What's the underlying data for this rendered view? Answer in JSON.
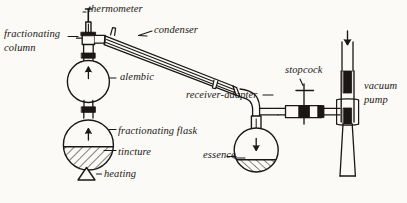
{
  "diagram": {
    "type": "hand-drawn scientific illustration",
    "background_color": "#fbfaf6",
    "ink_color": "#1a1714",
    "labels": [
      {
        "id": "thermometer",
        "text": "thermometer",
        "x": 88,
        "y": 5,
        "align": "left"
      },
      {
        "id": "fractionating-column",
        "text": "fractionating",
        "x": 4,
        "y": 30,
        "align": "left"
      },
      {
        "id": "column-line2",
        "text": "column",
        "x": 4,
        "y": 44,
        "align": "left"
      },
      {
        "id": "condenser",
        "text": "condenser",
        "x": 155,
        "y": 27,
        "align": "left"
      },
      {
        "id": "alembic",
        "text": "alembic",
        "x": 122,
        "y": 73,
        "align": "left"
      },
      {
        "id": "stopcock",
        "text": "stopcock",
        "x": 285,
        "y": 67,
        "align": "left"
      },
      {
        "id": "vacuum-pump",
        "text": "vacuum",
        "x": 363,
        "y": 82,
        "align": "left"
      },
      {
        "id": "vacuum-pump-line2",
        "text": "pump",
        "x": 363,
        "y": 96,
        "align": "left"
      },
      {
        "id": "receiver-adapter",
        "text": "receiver-adapter",
        "x": 188,
        "y": 91,
        "align": "left"
      },
      {
        "id": "fractionating-flask",
        "text": "fractionating flask",
        "x": 119,
        "y": 127,
        "align": "left"
      },
      {
        "id": "tincture",
        "text": "tincture",
        "x": 119,
        "y": 148,
        "align": "left"
      },
      {
        "id": "essence",
        "text": "essence",
        "x": 204,
        "y": 151,
        "align": "left"
      },
      {
        "id": "heating",
        "text": "heating",
        "x": 104,
        "y": 174,
        "align": "left"
      }
    ],
    "components": [
      {
        "id": "thermometer",
        "name": "thermometer",
        "note": "vertical stem with cross bar at top entering the column head"
      },
      {
        "id": "fractionating-column",
        "name": "fractionating column",
        "note": "vertical column above the alembic with ground-glass joints"
      },
      {
        "id": "condenser",
        "name": "condenser",
        "note": "long sloping water-jacketed tube running down to the right"
      },
      {
        "id": "alembic",
        "name": "alembic",
        "note": "upper spherical flask, vapour rises (up arrow)"
      },
      {
        "id": "fractionating-flask",
        "name": "fractionating flask",
        "note": "lower spherical flask containing the tincture, vapour rises (up arrow)"
      },
      {
        "id": "tincture",
        "name": "tincture",
        "note": "hatched liquid filling the lower half of the fractionating flask"
      },
      {
        "id": "heating",
        "name": "heating",
        "note": "triangle symbol denoting applied heat"
      },
      {
        "id": "receiver-adapter",
        "name": "receiver-adapter",
        "note": "bent adapter joining condenser outlet to the receiving flask"
      },
      {
        "id": "essence",
        "name": "essence",
        "note": "hatched distillate collected in the receiving flask (down arrow)"
      },
      {
        "id": "stopcock",
        "name": "stopcock",
        "note": "T-handled tap on the horizontal line to the vacuum pump"
      },
      {
        "id": "vacuum-pump",
        "name": "vacuum pump",
        "note": "vertical tube at far right with down arrow at top"
      }
    ],
    "arrows": [
      {
        "id": "alembic-arrow",
        "direction": "up",
        "in": "alembic"
      },
      {
        "id": "flask-arrow",
        "direction": "up",
        "in": "fractionating flask"
      },
      {
        "id": "essence-arrow",
        "direction": "down",
        "in": "receiving flask"
      },
      {
        "id": "pump-arrow",
        "direction": "down",
        "in": "vacuum pump"
      }
    ]
  }
}
